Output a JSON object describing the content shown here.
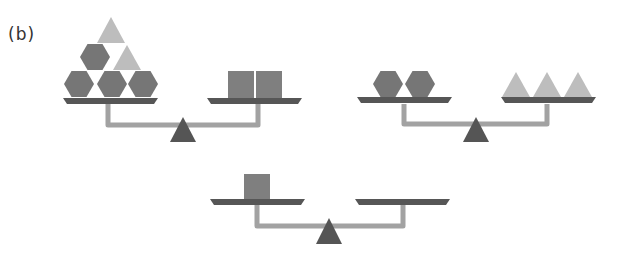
{
  "figure": {
    "label": "(b)"
  },
  "colors": {
    "hexagon": "#767676",
    "square": "#7f7f7f",
    "triangle": "#bdbdbd",
    "pan": "#565656",
    "beam": "#a2a2a2",
    "fulcrum": "#555555"
  },
  "scales": [
    {
      "id": "scale-1",
      "left_pan": {
        "hexagons": 4,
        "triangles": 2
      },
      "right_pan": {
        "squares": 2
      },
      "state": "balanced"
    },
    {
      "id": "scale-2",
      "left_pan": {
        "hexagons": 2
      },
      "right_pan": {
        "triangles": 3
      },
      "state": "balanced"
    },
    {
      "id": "scale-3",
      "left_pan": {
        "squares": 1
      },
      "right_pan": {},
      "state": "balanced (question: what goes on the right?)"
    }
  ]
}
